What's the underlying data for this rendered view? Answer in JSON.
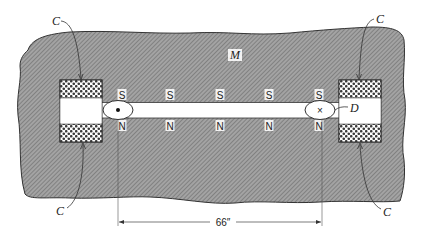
{
  "diagram": {
    "labels": {
      "material": "M",
      "detector": "D",
      "coil": "C",
      "dimension": "66″"
    },
    "poles": {
      "top": [
        "S",
        "S",
        "S",
        "S",
        "S"
      ],
      "bottom": [
        "N",
        "N",
        "N",
        "N",
        "N"
      ],
      "x_positions": [
        122,
        170,
        220,
        269,
        319
      ]
    },
    "current_markers": {
      "left": "dot",
      "right": "×"
    },
    "colors": {
      "hatch_fill": "#9a9a9a",
      "hatch_line": "#6e6e6e",
      "outline": "#333333",
      "background": "#ffffff"
    }
  }
}
